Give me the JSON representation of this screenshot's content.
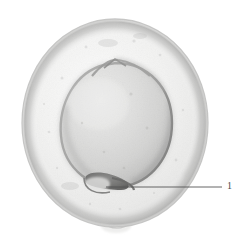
{
  "figure": {
    "type": "micrograph",
    "background_color": "#ffffff",
    "specimen": {
      "outer_membrane": {
        "name": "outer-membrane",
        "center_x": 115,
        "center_y": 123,
        "radius_x": 93,
        "radius_y": 104,
        "fill_color": "#f1f1f0",
        "edge_color": "#c9c9c8",
        "bottom_bump": {
          "name": "outer-membrane-bottom-bump",
          "center_x": 116,
          "center_y": 228,
          "width": 22,
          "height": 9
        }
      },
      "inner_body": {
        "name": "inner-body",
        "center_x": 116,
        "center_y": 125,
        "radius_x": 54,
        "radius_y": 62,
        "fill_color": "#dcdcdb",
        "edge_color": "#9c9c9b",
        "rim_shadow_color": "#8e8e8d"
      },
      "apical_ridge": {
        "name": "apical-ridge",
        "center_x": 112,
        "center_y": 62
      },
      "basal_notch": {
        "name": "basal-notch",
        "center_x": 103,
        "center_y": 182,
        "width": 34,
        "height": 16,
        "color": "#6d6d6c"
      }
    },
    "annotations": [
      {
        "id": "annotation-1",
        "label": "1",
        "points_to": "basal-notch",
        "leader_line": {
          "x1": 106,
          "y1": 187,
          "x2": 222,
          "y2": 187,
          "color": "#555555",
          "width": 0.8
        },
        "label_x": 227,
        "label_y": 182,
        "label_color": "#4a4a4a"
      }
    ]
  }
}
